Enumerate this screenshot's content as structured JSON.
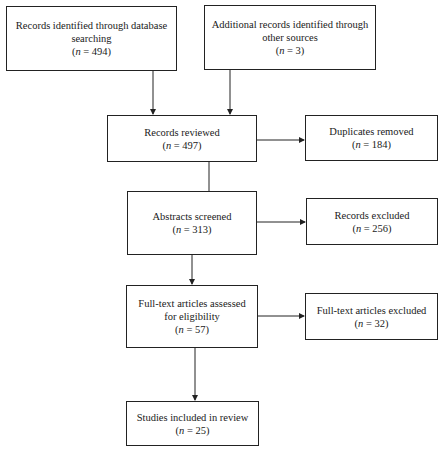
{
  "flowchart": {
    "nodes": [
      {
        "id": "identified_db",
        "label": "Records identified through database searching",
        "n": "494"
      },
      {
        "id": "identified_other",
        "label": "Additional records identified through other sources",
        "n": "3"
      },
      {
        "id": "reviewed",
        "label": "Records reviewed",
        "n": "497"
      },
      {
        "id": "duplicates",
        "label": "Duplicates removed",
        "n": "184"
      },
      {
        "id": "abstracts",
        "label": "Abstracts screened",
        "n": "313"
      },
      {
        "id": "records_excluded",
        "label": "Records excluded",
        "n": "256"
      },
      {
        "id": "fulltext",
        "label": "Full-text articles assessed for eligibility",
        "n": "57"
      },
      {
        "id": "fulltext_excluded",
        "label": "Full-text articles excluded",
        "n": "32"
      },
      {
        "id": "included",
        "label": "Studies included in review",
        "n": "25"
      }
    ],
    "n_prefix": "n",
    "n_eq": " = "
  }
}
